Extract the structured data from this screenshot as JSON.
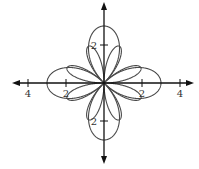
{
  "chart_data": {
    "type": "line",
    "subtype": "polar-rose",
    "title": "",
    "xlabel": "",
    "ylabel": "",
    "xlim": [
      -4.8,
      4.8
    ],
    "ylim": [
      -4.3,
      4.3
    ],
    "grid": false,
    "x_ticks": [
      {
        "value": -4,
        "label": "4"
      },
      {
        "value": -2,
        "label": "2"
      },
      {
        "value": 2,
        "label": "2"
      },
      {
        "value": 4,
        "label": "4"
      }
    ],
    "y_ticks": [
      {
        "value": 2,
        "label": "2"
      },
      {
        "value": -2,
        "label": "2"
      }
    ],
    "series": [
      {
        "name": "large four-petal rose (petals on axes)",
        "petals": 4,
        "max_radius": 3,
        "petal_angles_deg": [
          0,
          90,
          180,
          270
        ]
      },
      {
        "name": "small eight-petal rose",
        "petals": 8,
        "max_radius": 2.1,
        "petal_angles_deg": [
          22.5,
          67.5,
          112.5,
          157.5,
          202.5,
          247.5,
          292.5,
          337.5
        ]
      }
    ],
    "origin_px": [
      104,
      83
    ],
    "unit_px": 19
  },
  "colors": {
    "curve": "#4a4a4a",
    "axis": "#111111",
    "background": "#ffffff"
  }
}
